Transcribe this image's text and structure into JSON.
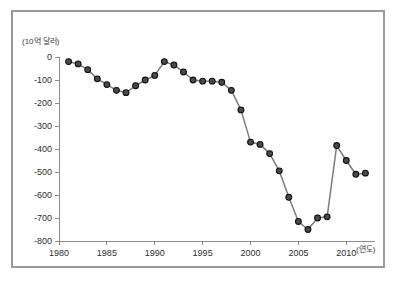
{
  "top_strip": {
    "ghost_text": "· · · · · · · · · ·"
  },
  "figure": {
    "background_color": "#ffffff",
    "border_color": "#9a9a9a"
  },
  "chart_data": {
    "type": "line",
    "title": "",
    "subtitle": "",
    "xlabel": "(연도)",
    "ylabel": "(10억 달러)",
    "xlim": [
      1980,
      2013
    ],
    "ylim": [
      -800,
      0
    ],
    "grid": false,
    "legend": null,
    "series_color": "#7d7d7d",
    "marker_color": "#4a4a4a",
    "marker_edge_color": "#111111",
    "x_ticks": [
      1980,
      1985,
      1990,
      1995,
      2000,
      2005,
      2010
    ],
    "x_tick_labels": [
      "1980",
      "1985",
      "1990",
      "1995",
      "2000",
      "2005",
      "2010"
    ],
    "y_ticks": [
      0,
      -100,
      -200,
      -300,
      -400,
      -500,
      -600,
      -700,
      -800
    ],
    "y_tick_labels": [
      "0",
      "-100",
      "-200",
      "-300",
      "-400",
      "-500",
      "-600",
      "-700",
      "-800"
    ],
    "x": [
      1981,
      1982,
      1983,
      1984,
      1985,
      1986,
      1987,
      1988,
      1989,
      1990,
      1991,
      1992,
      1993,
      1994,
      1995,
      1996,
      1997,
      1998,
      1999,
      2000,
      2001,
      2002,
      2003,
      2004,
      2005,
      2006,
      2007,
      2008,
      2009,
      2010,
      2011,
      2012
    ],
    "values": [
      -20,
      -30,
      -55,
      -95,
      -120,
      -145,
      -155,
      -125,
      -100,
      -80,
      -20,
      -35,
      -65,
      -100,
      -105,
      -105,
      -110,
      -145,
      -230,
      -370,
      -380,
      -420,
      -495,
      -610,
      -715,
      -750,
      -700,
      -695,
      -385,
      -450,
      -510,
      -505
    ],
    "categories": [
      "1981",
      "1982",
      "1983",
      "1984",
      "1985",
      "1986",
      "1987",
      "1988",
      "1989",
      "1990",
      "1991",
      "1992",
      "1993",
      "1994",
      "1995",
      "1996",
      "1997",
      "1998",
      "1999",
      "2000",
      "2001",
      "2002",
      "2003",
      "2004",
      "2005",
      "2006",
      "2007",
      "2008",
      "2009",
      "2010",
      "2011",
      "2012"
    ],
    "series": [
      {
        "name": "",
        "values": [
          -20,
          -30,
          -55,
          -95,
          -120,
          -145,
          -155,
          -125,
          -100,
          -80,
          -20,
          -35,
          -65,
          -100,
          -105,
          -105,
          -110,
          -145,
          -230,
          -370,
          -380,
          -420,
          -495,
          -610,
          -715,
          -750,
          -700,
          -695,
          -385,
          -450,
          -510,
          -505
        ]
      }
    ]
  }
}
